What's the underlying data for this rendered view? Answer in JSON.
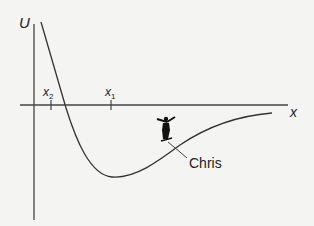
{
  "diagram": {
    "type": "potential-energy-curve",
    "axes": {
      "y_label": "U",
      "x_label": "x"
    },
    "markers": [
      {
        "label": "x",
        "subscript": "2"
      },
      {
        "label": "x",
        "subscript": "1"
      }
    ],
    "annotation": {
      "label": "Chris",
      "icon": "skateboarder-icon"
    },
    "colors": {
      "line": "#333333",
      "background": "#f4f4f2"
    }
  }
}
